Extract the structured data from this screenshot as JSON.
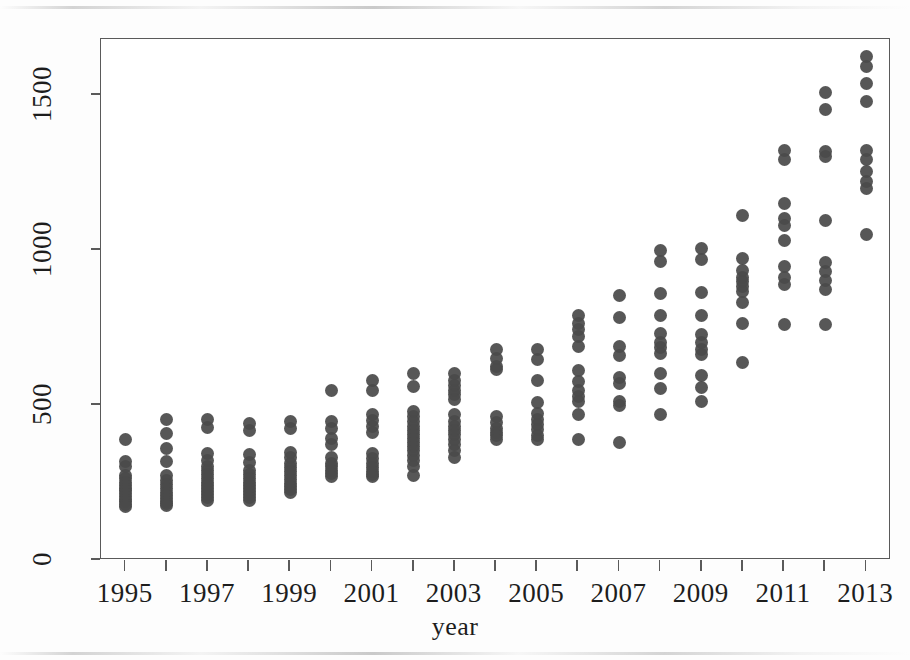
{
  "chart_data": {
    "type": "scatter",
    "title": "",
    "subtitle": "",
    "xlabel": "year",
    "ylabel": "",
    "xlim": [
      1994.4,
      2013.6
    ],
    "ylim": [
      0,
      1680
    ],
    "grid": false,
    "legend": null,
    "point_color": "#4a4a4a",
    "point_shape": "filled-circle",
    "x_ticks": [
      1995,
      1997,
      1999,
      2001,
      2003,
      2005,
      2007,
      2009,
      2011,
      2013
    ],
    "x_tick_labels": [
      "1995",
      "1997",
      "1999",
      "2001",
      "2003",
      "2005",
      "2007",
      "2009",
      "2011",
      "2013"
    ],
    "x_minor_ticks": [
      1996,
      1998,
      2000,
      2002,
      2004,
      2006,
      2008,
      2010,
      2012
    ],
    "y_ticks": [
      0,
      500,
      1000,
      1500
    ],
    "y_tick_labels": [
      "0",
      "500",
      "1000",
      "1500"
    ],
    "series": [
      {
        "name": "observations",
        "points": [
          {
            "x": 1995,
            "y": 390
          },
          {
            "x": 1995,
            "y": 318
          },
          {
            "x": 1995,
            "y": 300
          },
          {
            "x": 1995,
            "y": 272
          },
          {
            "x": 1995,
            "y": 262
          },
          {
            "x": 1995,
            "y": 250
          },
          {
            "x": 1995,
            "y": 240
          },
          {
            "x": 1995,
            "y": 232
          },
          {
            "x": 1995,
            "y": 224
          },
          {
            "x": 1995,
            "y": 214
          },
          {
            "x": 1995,
            "y": 205
          },
          {
            "x": 1995,
            "y": 196
          },
          {
            "x": 1995,
            "y": 188
          },
          {
            "x": 1995,
            "y": 180
          },
          {
            "x": 1995,
            "y": 174
          },
          {
            "x": 1996,
            "y": 452
          },
          {
            "x": 1996,
            "y": 408
          },
          {
            "x": 1996,
            "y": 360
          },
          {
            "x": 1996,
            "y": 318
          },
          {
            "x": 1996,
            "y": 272
          },
          {
            "x": 1996,
            "y": 256
          },
          {
            "x": 1996,
            "y": 242
          },
          {
            "x": 1996,
            "y": 230
          },
          {
            "x": 1996,
            "y": 218
          },
          {
            "x": 1996,
            "y": 208
          },
          {
            "x": 1996,
            "y": 198
          },
          {
            "x": 1996,
            "y": 190
          },
          {
            "x": 1996,
            "y": 182
          },
          {
            "x": 1996,
            "y": 176
          },
          {
            "x": 1997,
            "y": 452
          },
          {
            "x": 1997,
            "y": 428
          },
          {
            "x": 1997,
            "y": 342
          },
          {
            "x": 1997,
            "y": 320
          },
          {
            "x": 1997,
            "y": 300
          },
          {
            "x": 1997,
            "y": 288
          },
          {
            "x": 1997,
            "y": 276
          },
          {
            "x": 1997,
            "y": 262
          },
          {
            "x": 1997,
            "y": 250
          },
          {
            "x": 1997,
            "y": 240
          },
          {
            "x": 1997,
            "y": 230
          },
          {
            "x": 1997,
            "y": 220
          },
          {
            "x": 1997,
            "y": 210
          },
          {
            "x": 1997,
            "y": 200
          },
          {
            "x": 1997,
            "y": 192
          },
          {
            "x": 1998,
            "y": 440
          },
          {
            "x": 1998,
            "y": 418
          },
          {
            "x": 1998,
            "y": 340
          },
          {
            "x": 1998,
            "y": 316
          },
          {
            "x": 1998,
            "y": 290
          },
          {
            "x": 1998,
            "y": 276
          },
          {
            "x": 1998,
            "y": 262
          },
          {
            "x": 1998,
            "y": 250
          },
          {
            "x": 1998,
            "y": 240
          },
          {
            "x": 1998,
            "y": 230
          },
          {
            "x": 1998,
            "y": 220
          },
          {
            "x": 1998,
            "y": 210
          },
          {
            "x": 1998,
            "y": 200
          },
          {
            "x": 1998,
            "y": 192
          },
          {
            "x": 1999,
            "y": 448
          },
          {
            "x": 1999,
            "y": 425
          },
          {
            "x": 1999,
            "y": 348
          },
          {
            "x": 1999,
            "y": 330
          },
          {
            "x": 1999,
            "y": 312
          },
          {
            "x": 1999,
            "y": 298
          },
          {
            "x": 1999,
            "y": 286
          },
          {
            "x": 1999,
            "y": 272
          },
          {
            "x": 1999,
            "y": 260
          },
          {
            "x": 1999,
            "y": 248
          },
          {
            "x": 1999,
            "y": 238
          },
          {
            "x": 1999,
            "y": 228
          },
          {
            "x": 1999,
            "y": 218
          },
          {
            "x": 2000,
            "y": 545
          },
          {
            "x": 2000,
            "y": 446
          },
          {
            "x": 2000,
            "y": 425
          },
          {
            "x": 2000,
            "y": 392
          },
          {
            "x": 2000,
            "y": 372
          },
          {
            "x": 2000,
            "y": 330
          },
          {
            "x": 2000,
            "y": 310
          },
          {
            "x": 2000,
            "y": 300
          },
          {
            "x": 2000,
            "y": 290
          },
          {
            "x": 2000,
            "y": 280
          },
          {
            "x": 2000,
            "y": 270
          },
          {
            "x": 2001,
            "y": 580
          },
          {
            "x": 2001,
            "y": 545
          },
          {
            "x": 2001,
            "y": 470
          },
          {
            "x": 2001,
            "y": 450
          },
          {
            "x": 2001,
            "y": 430
          },
          {
            "x": 2001,
            "y": 412
          },
          {
            "x": 2001,
            "y": 345
          },
          {
            "x": 2001,
            "y": 328
          },
          {
            "x": 2001,
            "y": 312
          },
          {
            "x": 2001,
            "y": 298
          },
          {
            "x": 2001,
            "y": 286
          },
          {
            "x": 2001,
            "y": 276
          },
          {
            "x": 2001,
            "y": 268
          },
          {
            "x": 2002,
            "y": 600
          },
          {
            "x": 2002,
            "y": 560
          },
          {
            "x": 2002,
            "y": 478
          },
          {
            "x": 2002,
            "y": 462
          },
          {
            "x": 2002,
            "y": 448
          },
          {
            "x": 2002,
            "y": 432
          },
          {
            "x": 2002,
            "y": 418
          },
          {
            "x": 2002,
            "y": 404
          },
          {
            "x": 2002,
            "y": 392
          },
          {
            "x": 2002,
            "y": 380
          },
          {
            "x": 2002,
            "y": 366
          },
          {
            "x": 2002,
            "y": 352
          },
          {
            "x": 2002,
            "y": 338
          },
          {
            "x": 2002,
            "y": 320
          },
          {
            "x": 2002,
            "y": 300
          },
          {
            "x": 2002,
            "y": 274
          },
          {
            "x": 2003,
            "y": 600
          },
          {
            "x": 2003,
            "y": 580
          },
          {
            "x": 2003,
            "y": 564
          },
          {
            "x": 2003,
            "y": 548
          },
          {
            "x": 2003,
            "y": 534
          },
          {
            "x": 2003,
            "y": 518
          },
          {
            "x": 2003,
            "y": 470
          },
          {
            "x": 2003,
            "y": 448
          },
          {
            "x": 2003,
            "y": 432
          },
          {
            "x": 2003,
            "y": 418
          },
          {
            "x": 2003,
            "y": 404
          },
          {
            "x": 2003,
            "y": 390
          },
          {
            "x": 2003,
            "y": 372
          },
          {
            "x": 2003,
            "y": 352
          },
          {
            "x": 2003,
            "y": 330
          },
          {
            "x": 2004,
            "y": 680
          },
          {
            "x": 2004,
            "y": 650
          },
          {
            "x": 2004,
            "y": 625
          },
          {
            "x": 2004,
            "y": 615
          },
          {
            "x": 2004,
            "y": 462
          },
          {
            "x": 2004,
            "y": 442
          },
          {
            "x": 2004,
            "y": 425
          },
          {
            "x": 2004,
            "y": 412
          },
          {
            "x": 2004,
            "y": 400
          },
          {
            "x": 2004,
            "y": 388
          },
          {
            "x": 2005,
            "y": 678
          },
          {
            "x": 2005,
            "y": 648
          },
          {
            "x": 2005,
            "y": 578
          },
          {
            "x": 2005,
            "y": 508
          },
          {
            "x": 2005,
            "y": 472
          },
          {
            "x": 2005,
            "y": 452
          },
          {
            "x": 2005,
            "y": 436
          },
          {
            "x": 2005,
            "y": 420
          },
          {
            "x": 2005,
            "y": 400
          },
          {
            "x": 2005,
            "y": 388
          },
          {
            "x": 2006,
            "y": 790
          },
          {
            "x": 2006,
            "y": 762
          },
          {
            "x": 2006,
            "y": 742
          },
          {
            "x": 2006,
            "y": 722
          },
          {
            "x": 2006,
            "y": 690
          },
          {
            "x": 2006,
            "y": 612
          },
          {
            "x": 2006,
            "y": 576
          },
          {
            "x": 2006,
            "y": 545
          },
          {
            "x": 2006,
            "y": 528
          },
          {
            "x": 2006,
            "y": 512
          },
          {
            "x": 2006,
            "y": 470
          },
          {
            "x": 2006,
            "y": 390
          },
          {
            "x": 2007,
            "y": 852
          },
          {
            "x": 2007,
            "y": 782
          },
          {
            "x": 2007,
            "y": 690
          },
          {
            "x": 2007,
            "y": 660
          },
          {
            "x": 2007,
            "y": 588
          },
          {
            "x": 2007,
            "y": 568
          },
          {
            "x": 2007,
            "y": 512
          },
          {
            "x": 2007,
            "y": 498
          },
          {
            "x": 2007,
            "y": 380
          },
          {
            "x": 2008,
            "y": 998
          },
          {
            "x": 2008,
            "y": 962
          },
          {
            "x": 2008,
            "y": 858
          },
          {
            "x": 2008,
            "y": 790
          },
          {
            "x": 2008,
            "y": 730
          },
          {
            "x": 2008,
            "y": 702
          },
          {
            "x": 2008,
            "y": 684
          },
          {
            "x": 2008,
            "y": 666
          },
          {
            "x": 2008,
            "y": 600
          },
          {
            "x": 2008,
            "y": 552
          },
          {
            "x": 2008,
            "y": 468
          },
          {
            "x": 2009,
            "y": 1005
          },
          {
            "x": 2009,
            "y": 968
          },
          {
            "x": 2009,
            "y": 862
          },
          {
            "x": 2009,
            "y": 788
          },
          {
            "x": 2009,
            "y": 726
          },
          {
            "x": 2009,
            "y": 700
          },
          {
            "x": 2009,
            "y": 680
          },
          {
            "x": 2009,
            "y": 662
          },
          {
            "x": 2009,
            "y": 596
          },
          {
            "x": 2009,
            "y": 556
          },
          {
            "x": 2009,
            "y": 510
          },
          {
            "x": 2010,
            "y": 1112
          },
          {
            "x": 2010,
            "y": 972
          },
          {
            "x": 2010,
            "y": 932
          },
          {
            "x": 2010,
            "y": 912
          },
          {
            "x": 2010,
            "y": 898
          },
          {
            "x": 2010,
            "y": 882
          },
          {
            "x": 2010,
            "y": 866
          },
          {
            "x": 2010,
            "y": 830
          },
          {
            "x": 2010,
            "y": 762
          },
          {
            "x": 2010,
            "y": 636
          },
          {
            "x": 2011,
            "y": 1320
          },
          {
            "x": 2011,
            "y": 1292
          },
          {
            "x": 2011,
            "y": 1148
          },
          {
            "x": 2011,
            "y": 1102
          },
          {
            "x": 2011,
            "y": 1078
          },
          {
            "x": 2011,
            "y": 1030
          },
          {
            "x": 2011,
            "y": 948
          },
          {
            "x": 2011,
            "y": 912
          },
          {
            "x": 2011,
            "y": 888
          },
          {
            "x": 2011,
            "y": 760
          },
          {
            "x": 2012,
            "y": 1508
          },
          {
            "x": 2012,
            "y": 1452
          },
          {
            "x": 2012,
            "y": 1318
          },
          {
            "x": 2012,
            "y": 1300
          },
          {
            "x": 2012,
            "y": 1095
          },
          {
            "x": 2012,
            "y": 960
          },
          {
            "x": 2012,
            "y": 930
          },
          {
            "x": 2012,
            "y": 902
          },
          {
            "x": 2012,
            "y": 872
          },
          {
            "x": 2012,
            "y": 760
          },
          {
            "x": 2013,
            "y": 1625
          },
          {
            "x": 2013,
            "y": 1592
          },
          {
            "x": 2013,
            "y": 1535
          },
          {
            "x": 2013,
            "y": 1478
          },
          {
            "x": 2013,
            "y": 1320
          },
          {
            "x": 2013,
            "y": 1292
          },
          {
            "x": 2013,
            "y": 1252
          },
          {
            "x": 2013,
            "y": 1222
          },
          {
            "x": 2013,
            "y": 1198
          },
          {
            "x": 2013,
            "y": 1048
          }
        ]
      }
    ]
  },
  "axis": {
    "x_title": "year"
  }
}
